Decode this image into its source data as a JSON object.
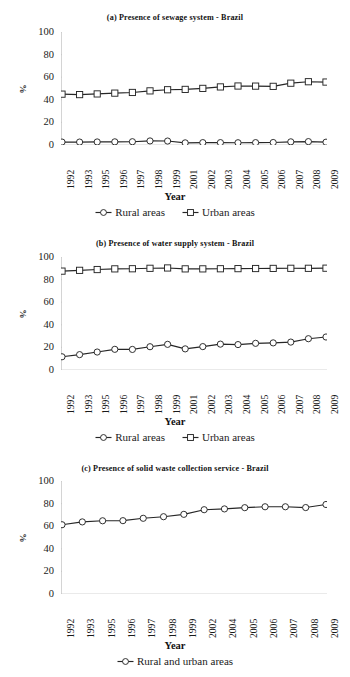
{
  "figure": {
    "axis_title": "Year",
    "y_axis_label": "%"
  },
  "chart_data": [
    {
      "id": "a",
      "type": "line",
      "title": "(a) Presence of sewage system - Brazil",
      "xlabel": "Year",
      "ylabel": "%",
      "ylim": [
        0,
        100
      ],
      "yticks": [
        0,
        20,
        40,
        60,
        80,
        100
      ],
      "grid": false,
      "legend_position": "bottom",
      "categories": [
        "1992",
        "1993",
        "1995",
        "1996",
        "1997",
        "1998",
        "1999",
        "2001",
        "2002",
        "2003",
        "2004",
        "2005",
        "2006",
        "2007",
        "2008",
        "2009"
      ],
      "series": [
        {
          "name": "Rural areas",
          "marker": "circle",
          "values": [
            2.6,
            2.6,
            2.7,
            2.8,
            2.9,
            3.6,
            3.5,
            1.9,
            2.1,
            2.1,
            2.0,
            2.1,
            2.2,
            2.8,
            3.0,
            2.5
          ]
        },
        {
          "name": "Urban areas",
          "marker": "square",
          "values": [
            45.0,
            44.6,
            45.2,
            45.9,
            46.5,
            47.9,
            48.9,
            49.2,
            50.1,
            51.4,
            52.2,
            52.1,
            51.9,
            54.7,
            56.0,
            55.7
          ]
        }
      ]
    },
    {
      "id": "b",
      "type": "line",
      "title": "(b) Presence of water supply system - Brazil",
      "xlabel": "Year",
      "ylabel": "%",
      "ylim": [
        0,
        100
      ],
      "yticks": [
        0,
        20,
        40,
        60,
        80,
        100
      ],
      "grid": false,
      "legend_position": "bottom",
      "categories": [
        "1992",
        "1993",
        "1995",
        "1996",
        "1997",
        "1998",
        "1999",
        "2001",
        "2002",
        "2003",
        "2004",
        "2005",
        "2006",
        "2007",
        "2008",
        "2009"
      ],
      "series": [
        {
          "name": "Rural areas",
          "marker": "circle",
          "values": [
            11.7,
            13.6,
            15.9,
            18.3,
            18.2,
            20.6,
            22.7,
            18.7,
            20.7,
            22.9,
            22.5,
            23.6,
            24.0,
            24.7,
            27.7,
            29.2
          ]
        },
        {
          "name": "Urban areas",
          "marker": "square",
          "values": [
            87.5,
            88.2,
            88.9,
            89.5,
            89.6,
            90.0,
            90.3,
            89.5,
            89.5,
            89.6,
            89.7,
            89.8,
            89.9,
            90.0,
            90.0,
            90.1
          ]
        }
      ]
    },
    {
      "id": "c",
      "type": "line",
      "title": "(c) Presence of solid waste collection service - Brazil",
      "xlabel": "Year",
      "ylabel": "%",
      "ylim": [
        0,
        100
      ],
      "yticks": [
        0,
        20,
        40,
        60,
        80,
        100
      ],
      "grid": false,
      "legend_position": "bottom",
      "categories": [
        "1992",
        "1993",
        "1995",
        "1996",
        "1997",
        "1998",
        "1999",
        "2002",
        "2004",
        "2005",
        "2006",
        "2007",
        "2008",
        "2009"
      ],
      "series": [
        {
          "name": "Rural and urban areas",
          "marker": "circle",
          "values": [
            61.3,
            63.8,
            64.8,
            64.9,
            67.0,
            68.4,
            70.5,
            74.6,
            75.3,
            76.4,
            77.2,
            77.2,
            76.5,
            79.2
          ]
        }
      ]
    }
  ]
}
